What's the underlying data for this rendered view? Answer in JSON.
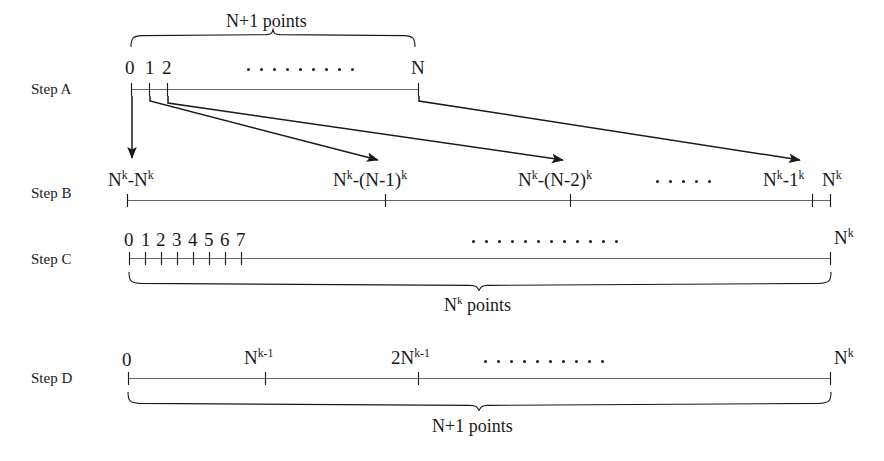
{
  "figure": {
    "ink_color": "#1a1a1a",
    "background": "#ffffff"
  },
  "steps": [
    {
      "id": "A",
      "label": "Step A"
    },
    {
      "id": "B",
      "label": "Step B"
    },
    {
      "id": "C",
      "label": "Step C"
    },
    {
      "id": "D",
      "label": "Step D"
    }
  ],
  "step_a": {
    "label": "Step A",
    "brace_label": "N+1 points",
    "tick_labels": [
      "0",
      "1",
      "2",
      "N"
    ],
    "ellipsis_dots": 9
  },
  "step_b": {
    "label": "Step B",
    "tick_labels": [
      {
        "base": "N",
        "text": "Nᵏ-Nᵏ"
      },
      {
        "base": "N",
        "text": "Nᵏ-(N-1)ᵏ"
      },
      {
        "base": "N",
        "text": "Nᵏ-(N-2)ᵏ"
      },
      {
        "base": "N",
        "text": "Nᵏ-1ᵏ"
      },
      {
        "base": "N",
        "text": "Nᵏ"
      }
    ],
    "ellipsis_dots": 5
  },
  "step_c": {
    "label": "Step C",
    "tick_labels": [
      "0",
      "1",
      "2",
      "3",
      "4",
      "5",
      "6",
      "7"
    ],
    "end_label": "Nᵏ",
    "brace_label": "Nᵏ points",
    "ellipsis_dots": 12
  },
  "step_d": {
    "label": "Step D",
    "tick_labels": [
      "0",
      "Nᵏ⁻¹",
      "2Nᵏ⁻¹"
    ],
    "end_label": "Nᵏ",
    "brace_label": "N+1 points",
    "ellipsis_dots": 10
  },
  "arrows": [
    {
      "name": "arrow-from-0",
      "from_tick": "0",
      "to": "Nᵏ-Nᵏ"
    },
    {
      "name": "arrow-from-1",
      "from_tick": "1",
      "to": "Nᵏ-(N-1)ᵏ"
    },
    {
      "name": "arrow-from-2",
      "from_tick": "2",
      "to": "Nᵏ-(N-2)ᵏ"
    },
    {
      "name": "arrow-from-N",
      "from_tick": "N",
      "to": "Nᵏ-1ᵏ"
    }
  ],
  "text": {
    "step_a_label": "Step A",
    "step_b_label": "Step B",
    "step_c_label": "Step C",
    "step_d_label": "Step D",
    "a_brace": "N+1 points",
    "a_t0": "0",
    "a_t1": "1",
    "a_t2": "2",
    "a_tN": "N",
    "c_t0": "0",
    "c_t1": "1",
    "c_t2": "2",
    "c_t3": "3",
    "c_t4": "4",
    "c_t5": "5",
    "c_t6": "6",
    "c_t7": "7",
    "c_brace": "points",
    "d_t0": "0",
    "d_brace": "N+1 points",
    "b_dots": "· · · · ·"
  }
}
